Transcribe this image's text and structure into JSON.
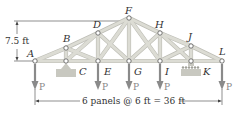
{
  "diagram": {
    "type": "roof truss with loads",
    "height_dimension": "7.5 ft",
    "span_dimension": "6 panels @ 6 ft = 36 ft",
    "load_label": "P",
    "nodes": [
      {
        "id": "A",
        "label": "A",
        "x": 35,
        "y": 61,
        "lx": 27,
        "ly": 57
      },
      {
        "id": "B",
        "label": "B",
        "x": 66,
        "y": 48,
        "lx": 63,
        "ly": 42
      },
      {
        "id": "C",
        "label": "C",
        "x": 66,
        "y": 61,
        "lx": 79,
        "ly": 75
      },
      {
        "id": "D",
        "label": "D",
        "x": 98,
        "y": 33,
        "lx": 93,
        "ly": 28
      },
      {
        "id": "E",
        "label": "E",
        "x": 98,
        "y": 61,
        "lx": 104,
        "ly": 75
      },
      {
        "id": "F",
        "label": "F",
        "x": 129,
        "y": 18,
        "lx": 125,
        "ly": 14
      },
      {
        "id": "G",
        "label": "G",
        "x": 129,
        "y": 61,
        "lx": 134,
        "ly": 75
      },
      {
        "id": "H",
        "label": "H",
        "x": 160,
        "y": 33,
        "lx": 155,
        "ly": 28
      },
      {
        "id": "I",
        "label": "I",
        "x": 160,
        "y": 61,
        "lx": 165,
        "ly": 75
      },
      {
        "id": "J",
        "label": "J",
        "x": 191,
        "y": 46,
        "lx": 188,
        "ly": 40
      },
      {
        "id": "K",
        "label": "K",
        "x": 191,
        "y": 61,
        "lx": 203,
        "ly": 75
      },
      {
        "id": "L",
        "label": "L",
        "x": 222,
        "y": 61,
        "lx": 219,
        "ly": 55
      }
    ],
    "members": [
      [
        "A",
        "B"
      ],
      [
        "B",
        "D"
      ],
      [
        "D",
        "F"
      ],
      [
        "F",
        "H"
      ],
      [
        "H",
        "J"
      ],
      [
        "J",
        "L"
      ],
      [
        "A",
        "C"
      ],
      [
        "C",
        "E"
      ],
      [
        "E",
        "G"
      ],
      [
        "G",
        "I"
      ],
      [
        "I",
        "K"
      ],
      [
        "K",
        "L"
      ],
      [
        "B",
        "C"
      ],
      [
        "D",
        "E"
      ],
      [
        "F",
        "G"
      ],
      [
        "H",
        "I"
      ],
      [
        "J",
        "K"
      ],
      [
        "B",
        "E"
      ],
      [
        "D",
        "G"
      ],
      [
        "F",
        "I"
      ],
      [
        "H",
        "K"
      ],
      [
        "C",
        "D"
      ],
      [
        "F",
        "E"
      ],
      [
        "G",
        "H"
      ],
      [
        "I",
        "J"
      ]
    ],
    "loads_at": [
      "A",
      "E",
      "G",
      "I",
      "L"
    ],
    "supports": [
      {
        "node": "C",
        "type": "pin"
      },
      {
        "node": "K",
        "type": "roller"
      }
    ],
    "colors": {
      "member": "#dcdcd4",
      "member_edge": "#bdbdb5",
      "load_arrow": "#8a8a8a",
      "support": "#c8c8c0",
      "text": "#333333"
    }
  }
}
